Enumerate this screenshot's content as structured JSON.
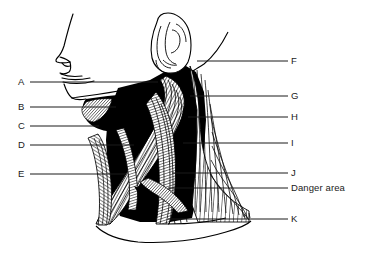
{
  "figure": {
    "type": "anatomical-line-diagram",
    "style": {
      "line_color": "#000000",
      "fill_black": "#000000",
      "background": "#ffffff",
      "leader_line_color": "#1a1a1a",
      "label_color": "#1a1a1a"
    }
  },
  "labels": {
    "left": [
      {
        "id": "A",
        "text": "A",
        "y": 82,
        "line_end_x": 158
      },
      {
        "id": "B",
        "text": "B",
        "y": 107,
        "line_end_x": 116
      },
      {
        "id": "C",
        "text": "C",
        "y": 126,
        "line_end_x": 99
      },
      {
        "id": "D",
        "text": "D",
        "y": 145,
        "line_end_x": 134
      },
      {
        "id": "E",
        "text": "E",
        "y": 174,
        "line_end_x": 126
      }
    ],
    "right": [
      {
        "id": "F",
        "text": "F",
        "y": 61,
        "line_start_x": 197
      },
      {
        "id": "G",
        "text": "G",
        "y": 96,
        "line_start_x": 190
      },
      {
        "id": "H",
        "text": "H",
        "y": 117,
        "line_start_x": 188
      },
      {
        "id": "I",
        "text": "I",
        "y": 143,
        "line_start_x": 183
      },
      {
        "id": "J",
        "text": "J",
        "y": 173,
        "line_start_x": 172
      },
      {
        "id": "DANGER",
        "text": "Danger area",
        "y": 188,
        "line_start_x": 168
      },
      {
        "id": "K",
        "text": "K",
        "y": 219,
        "line_start_x": 168
      }
    ]
  },
  "parts": {
    "face_profile": "face-profile",
    "ear": "ear",
    "mandible": "mandible",
    "sternocleidomastoid": "sternocleidomastoid-muscle",
    "trapezius": "trapezius-muscle",
    "platysma": "platysma-muscle",
    "clavicle": "clavicle",
    "shoulder": "shoulder"
  }
}
